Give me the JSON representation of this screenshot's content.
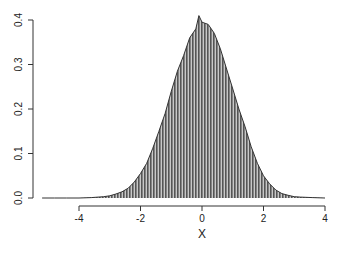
{
  "chart_data": {
    "type": "area",
    "title": "",
    "xlabel": "X",
    "ylabel": "",
    "xlim": [
      -5.2,
      4.0
    ],
    "ylim": [
      0.0,
      0.4
    ],
    "x_ticks": [
      -4,
      -2,
      0,
      2,
      4
    ],
    "x_tick_labels": [
      "-4",
      "-2",
      "0",
      "2",
      "4"
    ],
    "y_ticks": [
      0.0,
      0.1,
      0.2,
      0.3,
      0.4
    ],
    "y_tick_labels": [
      "0.0",
      "0.1",
      "0.2",
      "0.3",
      "0.4"
    ],
    "grid": false,
    "legend": null,
    "fill": "vertical-stripes",
    "colors": {
      "outline": "#333333",
      "stripe_dark": "#555555",
      "stripe_light": "#c8c8c8",
      "axis": "#333333"
    },
    "x": [
      -5.2,
      -4.8,
      -4.4,
      -4.0,
      -3.6,
      -3.2,
      -3.0,
      -2.8,
      -2.6,
      -2.4,
      -2.2,
      -2.0,
      -1.8,
      -1.6,
      -1.4,
      -1.2,
      -1.0,
      -0.8,
      -0.6,
      -0.4,
      -0.2,
      -0.1,
      0.0,
      0.2,
      0.4,
      0.6,
      0.8,
      1.0,
      1.2,
      1.4,
      1.6,
      1.8,
      2.0,
      2.2,
      2.4,
      2.6,
      2.8,
      3.0,
      3.2,
      3.6,
      4.0
    ],
    "values": [
      0.0,
      0.0,
      0.0,
      0.0,
      0.001,
      0.003,
      0.005,
      0.009,
      0.014,
      0.022,
      0.036,
      0.055,
      0.078,
      0.112,
      0.15,
      0.19,
      0.24,
      0.285,
      0.32,
      0.36,
      0.38,
      0.41,
      0.395,
      0.39,
      0.37,
      0.335,
      0.29,
      0.245,
      0.2,
      0.16,
      0.115,
      0.078,
      0.05,
      0.032,
      0.018,
      0.01,
      0.006,
      0.003,
      0.002,
      0.001,
      0.0
    ]
  }
}
